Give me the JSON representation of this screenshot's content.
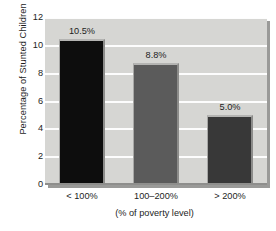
{
  "chart_data": {
    "type": "bar",
    "title": "",
    "categories": [
      "< 100%",
      "100–200%",
      "> 200%"
    ],
    "values": [
      10.5,
      8.8,
      5.0
    ],
    "data_labels": [
      "10.5%",
      "8.8%",
      "5.0%"
    ],
    "xlabel": "(% of poverty level)",
    "ylabel": "Percentage of Stunted Children",
    "ylim": [
      0,
      12
    ],
    "ytick_labels": [
      "0",
      "2",
      "4",
      "6",
      "8",
      "10",
      "12"
    ],
    "ytick_values": [
      0,
      2,
      4,
      6,
      8,
      10,
      12
    ],
    "grid": true,
    "legend": "none",
    "bar_colors": [
      "#0d0d0d",
      "#5b5b5b",
      "#383838"
    ],
    "plot_background": "#d6d6d3",
    "gridline_color": "#fdfdfd",
    "figure_background": "#ffffff"
  }
}
